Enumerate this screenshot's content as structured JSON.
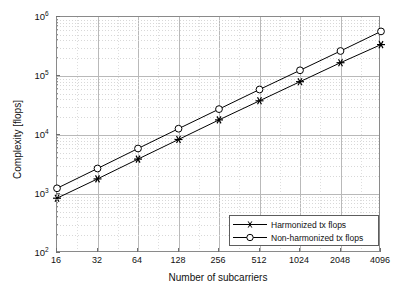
{
  "chart_data": {
    "type": "line",
    "title": "",
    "xlabel": "Number of subcarriers",
    "ylabel": "Complexity [flops]",
    "xscale": "log2",
    "yscale": "log10",
    "grid": true,
    "legend_position": "lower right",
    "x": [
      16,
      32,
      64,
      128,
      256,
      512,
      1024,
      2048,
      4096
    ],
    "categories": [
      "16",
      "32",
      "64",
      "128",
      "256",
      "512",
      "1024",
      "2048",
      "4096"
    ],
    "xlim": [
      16,
      4096
    ],
    "ylim": [
      100,
      1000000
    ],
    "ytick_labels": [
      "10",
      "10",
      "10",
      "10",
      "10"
    ],
    "ytick_exponents": [
      "2",
      "3",
      "4",
      "5",
      "6"
    ],
    "ytick_values": [
      100,
      1000,
      10000,
      100000,
      1000000
    ],
    "series": [
      {
        "name": "Harmonized tx flops",
        "marker": "star",
        "color": "#000000",
        "values": [
          850,
          1800,
          3900,
          8400,
          18000,
          38000,
          80000,
          168000,
          340000
        ]
      },
      {
        "name": "Non-harmonized tx flops",
        "marker": "circle",
        "color": "#000000",
        "values": [
          1250,
          2700,
          5900,
          12800,
          27500,
          59000,
          125000,
          265000,
          570000
        ]
      }
    ]
  },
  "legend": {
    "items": [
      {
        "label": "Harmonized tx flops",
        "marker": "star"
      },
      {
        "label": "Non-harmonized tx flops",
        "marker": "circle"
      }
    ]
  },
  "axes": {
    "x_title": "Number of subcarriers",
    "y_title": "Complexity [flops]"
  }
}
